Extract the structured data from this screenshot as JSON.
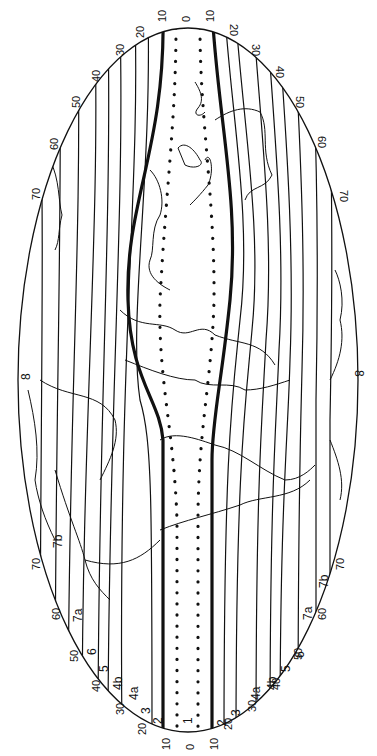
{
  "map": {
    "type": "climate-zone world map (rotated 90°, elliptical projection)",
    "colors": {
      "background": "#ffffff",
      "ink": "#111111"
    },
    "ellipse": {
      "cx": 188,
      "cy": 380,
      "rx": 170,
      "ry": 350
    },
    "latitude_labels": {
      "top": [
        "10",
        "0",
        "10"
      ],
      "left": [
        "20",
        "30",
        "40",
        "50",
        "60",
        "70"
      ],
      "right": [
        "20",
        "30",
        "40",
        "50",
        "60",
        "70"
      ],
      "bottom": [
        "10",
        "0",
        "10"
      ],
      "bottom_left": [
        "20",
        "30",
        "40",
        "50",
        "60",
        "70"
      ],
      "bottom_right": [
        "20",
        "30",
        "40",
        "50",
        "60",
        "70"
      ]
    },
    "zone_labels": {
      "bottom": [
        "1"
      ],
      "bottom_left": [
        "2",
        "3",
        "4a",
        "4b",
        "5",
        "6",
        "7a",
        "7b"
      ],
      "bottom_right": [
        "2",
        "3",
        "4a",
        "4b",
        "5",
        "6",
        "7a",
        "7b"
      ],
      "left_side": "8",
      "right_side": "8"
    },
    "line_styles": {
      "zone_1_boundary": "dotted",
      "zone_2_boundary": "thick",
      "other_boundaries": "thin"
    }
  }
}
